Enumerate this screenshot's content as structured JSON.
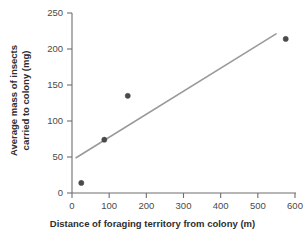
{
  "chart_data": {
    "type": "scatter",
    "title": "",
    "xlabel": "Distance of foraging territory from colony (m)",
    "ylabel_line1": "Average mass of insects",
    "ylabel_line2": "carried to colony (mg)",
    "ylabel": "Average mass of insects carried to colony (mg)",
    "xlim": [
      0,
      600
    ],
    "ylim": [
      0,
      250
    ],
    "xticks": [
      0,
      100,
      200,
      300,
      400,
      500,
      600
    ],
    "yticks": [
      0,
      50,
      100,
      150,
      200,
      250
    ],
    "xtick_labels": [
      "0",
      "100",
      "200",
      "300",
      "400",
      "500",
      "600"
    ],
    "ytick_labels": [
      "0",
      "50",
      "100",
      "150",
      "200",
      "250"
    ],
    "grid": false,
    "legend": "none",
    "point_color": "#4a4a4a",
    "line_color": "#9a9a9a",
    "axis_color": "#6e6e6e",
    "points": [
      {
        "x": 25,
        "y": 14
      },
      {
        "x": 87,
        "y": 74
      },
      {
        "x": 150,
        "y": 135
      },
      {
        "x": 575,
        "y": 214
      }
    ],
    "trendline": {
      "name": "line of best fit",
      "x_start": 11,
      "y_start": 49,
      "x_end": 549,
      "y_end": 221
    }
  }
}
